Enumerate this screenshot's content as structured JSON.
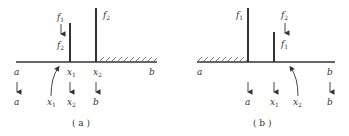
{
  "panels": [
    {
      "caption": "( a )",
      "top_labels": [
        {
          "base": "f",
          "sub": "1"
        },
        {
          "base": "f",
          "sub": "2"
        },
        {
          "base": "f",
          "sub": "2"
        }
      ],
      "axis_labels": [
        {
          "base": "a",
          "sub": ""
        },
        {
          "base": "x",
          "sub": "1"
        },
        {
          "base": "x",
          "sub": "2"
        },
        {
          "base": "b",
          "sub": ""
        }
      ],
      "bottom_labels": [
        {
          "base": "a",
          "sub": ""
        },
        {
          "base": "x",
          "sub": "1"
        },
        {
          "base": "x",
          "sub": "2"
        },
        {
          "base": "b",
          "sub": ""
        }
      ],
      "hatched_side": "right"
    },
    {
      "caption": "( b )",
      "top_labels": [
        {
          "base": "f",
          "sub": "1"
        },
        {
          "base": "f",
          "sub": "2"
        },
        {
          "base": "f",
          "sub": "1"
        }
      ],
      "axis_labels": [
        {
          "base": "a",
          "sub": ""
        },
        {
          "base": "b",
          "sub": ""
        }
      ],
      "bottom_labels": [
        {
          "base": "a",
          "sub": ""
        },
        {
          "base": "x",
          "sub": "1"
        },
        {
          "base": "x",
          "sub": "2"
        },
        {
          "base": "b",
          "sub": ""
        }
      ],
      "hatched_side": "left"
    }
  ],
  "colors": {
    "stroke": "#333333",
    "bg": "#ffffff"
  }
}
